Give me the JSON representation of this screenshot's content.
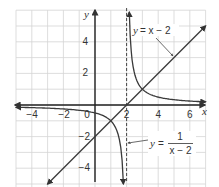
{
  "chart_data": {
    "type": "line",
    "title": "",
    "xlabel": "x",
    "ylabel": "y",
    "xlim": [
      -5,
      7
    ],
    "ylim": [
      -5,
      6
    ],
    "grid": true,
    "x_ticks": [
      -4,
      -2,
      0,
      2,
      4,
      6
    ],
    "y_ticks": [
      -4,
      -2,
      2,
      4
    ],
    "x_tick_labels": [
      "-4",
      "-2",
      "0",
      "2",
      "4",
      "6"
    ],
    "y_tick_labels": [
      "-4",
      "-2",
      "2",
      "4"
    ],
    "origin_label": "0",
    "series": [
      {
        "name": "y = x − 2",
        "kind": "line",
        "color": "#3a3a3a",
        "points": [
          [
            -3,
            -5
          ],
          [
            -2,
            -4
          ],
          [
            0,
            -2
          ],
          [
            2,
            0
          ],
          [
            4,
            2
          ],
          [
            6,
            4
          ],
          [
            7,
            5
          ]
        ]
      },
      {
        "name": "y = 1/(x − 2)",
        "kind": "hyperbola",
        "color": "#3a3a3a",
        "branches": [
          [
            [
              -5,
              -0.14
            ],
            [
              -4,
              -0.17
            ],
            [
              -2,
              -0.25
            ],
            [
              0,
              -0.5
            ],
            [
              1,
              -1
            ],
            [
              1.5,
              -2
            ],
            [
              1.75,
              -4
            ],
            [
              1.8,
              -5
            ]
          ],
          [
            [
              2.2,
              5
            ],
            [
              2.25,
              4
            ],
            [
              2.5,
              2
            ],
            [
              3,
              1
            ],
            [
              4,
              0.5
            ],
            [
              5,
              0.33
            ],
            [
              6,
              0.25
            ],
            [
              7,
              0.2
            ]
          ]
        ]
      }
    ],
    "asymptotes": [
      {
        "type": "vertical",
        "x": 2,
        "style": "dashed"
      }
    ],
    "annotations": [
      {
        "text": "y = x − 2",
        "points_to": [
          5,
          3
        ]
      },
      {
        "text": "y = 1/(x − 2)",
        "points_to": [
          2,
          -2.4
        ]
      }
    ],
    "legend": "none"
  },
  "labels": {
    "x_axis": "x",
    "y_axis": "y",
    "line_eq_y": "y",
    "line_eq_rest": "= x − 2",
    "hyp_eq_y": "y",
    "hyp_eq_eq": "=",
    "hyp_eq_num": "1",
    "hyp_eq_den": "x − 2",
    "ticks_x": [
      "−4",
      "−2",
      "0",
      "2",
      "4",
      "6"
    ],
    "ticks_y": [
      "4",
      "2",
      "−2",
      "−4"
    ]
  }
}
